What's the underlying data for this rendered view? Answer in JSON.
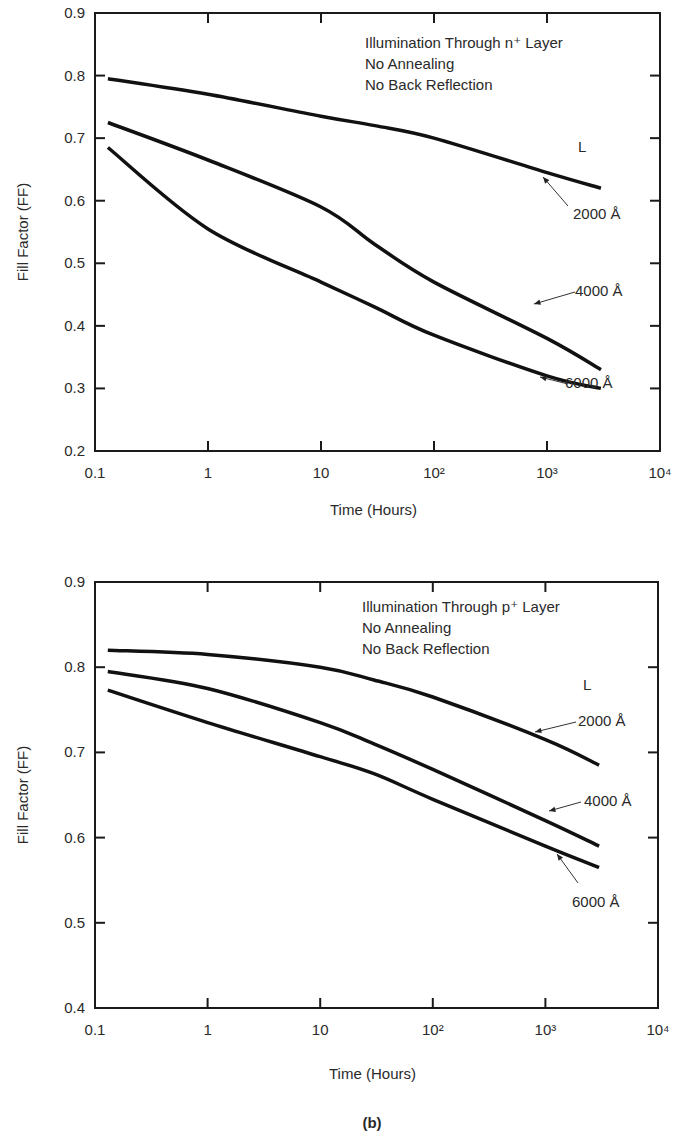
{
  "figure_caption": "(b)",
  "chart_data": [
    {
      "type": "line",
      "title": "",
      "annotation": [
        "Illumination Through n⁺ Layer",
        "No Annealing",
        "No Back Reflection"
      ],
      "legend_title": "L",
      "xlabel": "Time (Hours)",
      "ylabel": "Fill Factor (FF)",
      "xscale": "log",
      "xlim": [
        0.1,
        10000
      ],
      "ylim": [
        0.2,
        0.9
      ],
      "x_tick_labels": [
        "0.1",
        "1",
        "10",
        "10²",
        "10³",
        "10⁴"
      ],
      "y_tick_labels": [
        "0.2",
        "0.3",
        "0.4",
        "0.5",
        "0.6",
        "0.7",
        "0.8",
        "0.9"
      ],
      "grid": false,
      "x": [
        0.13,
        1,
        10,
        30,
        100,
        1000,
        3000
      ],
      "series": [
        {
          "name": "2000 Å",
          "values": [
            0.795,
            0.77,
            0.735,
            0.72,
            0.7,
            0.645,
            0.62
          ]
        },
        {
          "name": "4000 Å",
          "values": [
            0.725,
            0.665,
            0.59,
            0.53,
            0.47,
            0.38,
            0.33
          ]
        },
        {
          "name": "6000 Å",
          "values": [
            0.685,
            0.555,
            0.47,
            0.43,
            0.385,
            0.32,
            0.3
          ]
        }
      ]
    },
    {
      "type": "line",
      "title": "",
      "annotation": [
        "Illumination Through p⁺ Layer",
        "No Annealing",
        "No Back Reflection"
      ],
      "legend_title": "L",
      "xlabel": "Time (Hours)",
      "ylabel": "Fill Factor (FF)",
      "xscale": "log",
      "xlim": [
        0.1,
        10000
      ],
      "ylim": [
        0.4,
        0.9
      ],
      "x_tick_labels": [
        "0.1",
        "1",
        "10",
        "10²",
        "10³",
        "10⁴"
      ],
      "y_tick_labels": [
        "0.4",
        "0.5",
        "0.6",
        "0.7",
        "0.8",
        "0.9"
      ],
      "grid": false,
      "x": [
        0.13,
        1,
        10,
        30,
        100,
        1000,
        3000
      ],
      "series": [
        {
          "name": "2000 Å",
          "values": [
            0.82,
            0.815,
            0.8,
            0.785,
            0.765,
            0.715,
            0.685
          ]
        },
        {
          "name": "4000 Å",
          "values": [
            0.795,
            0.775,
            0.735,
            0.71,
            0.68,
            0.62,
            0.59
          ]
        },
        {
          "name": "6000 Å",
          "values": [
            0.773,
            0.735,
            0.695,
            0.675,
            0.645,
            0.59,
            0.565
          ]
        }
      ]
    }
  ]
}
